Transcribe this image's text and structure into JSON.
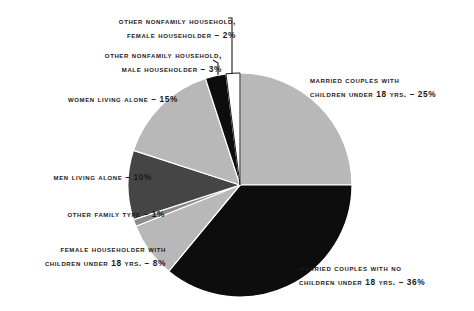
{
  "chart_data": {
    "type": "pie",
    "title": "",
    "subtitle": "",
    "xlabel": "",
    "ylabel": "",
    "legend_position": "none",
    "grid": false,
    "units": "percent",
    "start_angle_deg": 0,
    "direction": "clockwise",
    "categories": [
      "Married couples with children under 18 yrs.",
      "Married couples with no children under 18 yrs.",
      "Female householder with children under 18 yrs.",
      "Other family type",
      "Men living alone",
      "Women living alone",
      "Other nonfamily household, male householder",
      "Other nonfamily household, female householder"
    ],
    "values": [
      25,
      36,
      8,
      1,
      10,
      15,
      3,
      2
    ],
    "slices": [
      {
        "id": "married-children",
        "line1": "Married couples with",
        "line2": "children under 18 yrs. – 25%",
        "value": 25,
        "color": "#b8b8b8",
        "stroke": "#ffffff"
      },
      {
        "id": "married-nochild",
        "line1": "Married couples with no",
        "line2": "children under 18 yrs. – 36%",
        "value": 36,
        "color": "#0d0d0d",
        "stroke": "#ffffff"
      },
      {
        "id": "female-children",
        "line1": "Female householder with",
        "line2": "children under 18 yrs. – 8%",
        "value": 8,
        "color": "#b8b8b8",
        "stroke": "#ffffff"
      },
      {
        "id": "other-family",
        "line1": "Other family type – 1%",
        "line2": "",
        "value": 1,
        "color": "#8c8c8c",
        "stroke": "#ffffff"
      },
      {
        "id": "men-alone",
        "line1": "Men living alone – 10%",
        "line2": "",
        "value": 10,
        "color": "#454545",
        "stroke": "#ffffff"
      },
      {
        "id": "women-alone",
        "line1": "Women living alone – 15%",
        "line2": "",
        "value": 15,
        "color": "#b8b8b8",
        "stroke": "#ffffff"
      },
      {
        "id": "nonfamily-male",
        "line1": "Other nonfamily household,",
        "line2": "male householder – 3%",
        "value": 3,
        "color": "#0d0d0d",
        "stroke": "#ffffff"
      },
      {
        "id": "nonfamily-female",
        "line1": "Other nonfamily household,",
        "line2": "female householder – 2%",
        "value": 2,
        "color": "#ffffff",
        "stroke": "#1a1a1a"
      }
    ]
  },
  "geometry": {
    "center_x": 240,
    "center_y": 185,
    "radius": 112
  },
  "colors": {
    "light_gray": "#b8b8b8",
    "medium_gray": "#8c8c8c",
    "dark_gray": "#454545",
    "black": "#0d0d0d",
    "white": "#ffffff",
    "text": "#1a1a1a",
    "leader": "#1a1a1a"
  }
}
